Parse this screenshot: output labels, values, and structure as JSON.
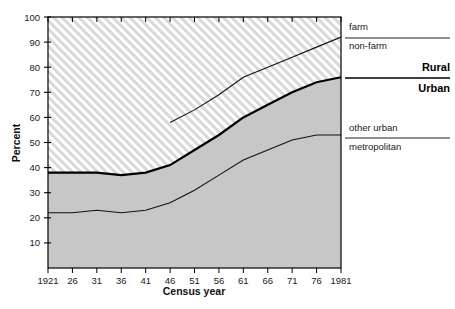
{
  "chart_data": {
    "type": "area",
    "title": "",
    "subtitle": "",
    "xlabel": "Census year",
    "ylabel": "Percent",
    "xlim": [
      1921,
      1981
    ],
    "ylim": [
      0,
      100
    ],
    "grid": false,
    "legend_position": "right",
    "x": [
      1921,
      1926,
      1931,
      1936,
      1941,
      1946,
      1951,
      1956,
      1961,
      1966,
      1971,
      1976,
      1981
    ],
    "xtick_labels": [
      "1921",
      "26",
      "31",
      "36",
      "41",
      "46",
      "51",
      "56",
      "61",
      "66",
      "71",
      "76",
      "1981"
    ],
    "ytick_labels": [
      "10",
      "20",
      "30",
      "40",
      "50",
      "60",
      "70",
      "80",
      "90",
      "100"
    ],
    "ytick_values": [
      10,
      20,
      30,
      40,
      50,
      60,
      70,
      80,
      90,
      100
    ],
    "series": [
      {
        "name": "metropolitan",
        "style": "thin-line-lower-boundary",
        "x": [
          1921,
          1926,
          1931,
          1936,
          1941,
          1946,
          1951,
          1956,
          1961,
          1966,
          1971,
          1976,
          1981
        ],
        "values": [
          22,
          22,
          23,
          22,
          23,
          26,
          31,
          37,
          43,
          47,
          51,
          53,
          53
        ]
      },
      {
        "name": "urban total",
        "style": "thick-line-boundary",
        "x": [
          1921,
          1926,
          1931,
          1936,
          1941,
          1946,
          1951,
          1956,
          1961,
          1966,
          1971,
          1976,
          1981
        ],
        "values": [
          38,
          38,
          38,
          37,
          38,
          41,
          47,
          53,
          60,
          65,
          70,
          74,
          76
        ]
      },
      {
        "name": "non-farm",
        "style": "thin-line-upper-boundary",
        "x": [
          1946,
          1951,
          1956,
          1961,
          1966,
          1971,
          1976,
          1981
        ],
        "values": [
          58,
          63,
          69,
          76,
          80,
          84,
          88,
          92
        ]
      }
    ],
    "regions": [
      {
        "name": "metropolitan",
        "fill": "solid-gray"
      },
      {
        "name": "other urban",
        "fill": "solid-gray"
      },
      {
        "name": "rural non-farm",
        "fill": "diagonal-hatch"
      },
      {
        "name": "farm",
        "fill": "diagonal-hatch"
      }
    ]
  },
  "axes": {
    "x_title": "Census year",
    "y_title": "Percent",
    "x_ticks": [
      "1921",
      "26",
      "31",
      "36",
      "41",
      "46",
      "51",
      "56",
      "61",
      "66",
      "71",
      "76",
      "1981"
    ],
    "y_ticks": [
      "10",
      "20",
      "30",
      "40",
      "50",
      "60",
      "70",
      "80",
      "90",
      "100"
    ]
  },
  "legend": {
    "farm": "farm",
    "non_farm": "non-farm",
    "rural": "Rural",
    "urban": "Urban",
    "other_urban": "other urban",
    "metropolitan": "metropolitan"
  },
  "colors": {
    "urban_fill": "#c7c7c7",
    "rural_hatch_line": "#b4b4b4",
    "rural_background": "#ffffff",
    "axis": "#000000",
    "text": "#1a1a1a"
  }
}
